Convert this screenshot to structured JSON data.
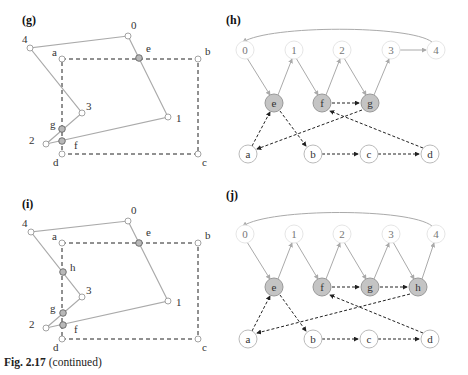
{
  "figure": {
    "caption_bold": "Fig. 2.17",
    "caption_rest": " (continued)",
    "colors": {
      "line_gray": "#aaaaaa",
      "dash": "#222222",
      "fill_intersect": "#b8b8b8",
      "node_stroke": "#999999"
    }
  },
  "panels": {
    "g": {
      "label": "(g)"
    },
    "h": {
      "label": "(h)"
    },
    "i": {
      "label": "(i)"
    },
    "j": {
      "label": "(j)"
    }
  },
  "polygon_nodes": [
    "0",
    "1",
    "2",
    "3",
    "4"
  ],
  "rect_nodes": [
    "a",
    "b",
    "c",
    "d"
  ],
  "intersections_g": [
    "e",
    "f",
    "g"
  ],
  "intersections_i": [
    "e",
    "f",
    "g",
    "h"
  ]
}
